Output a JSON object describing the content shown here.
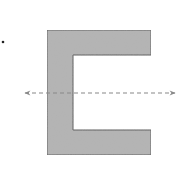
{
  "diagram": {
    "shape": {
      "type": "channel-section",
      "fill": "#b3b3b3",
      "stroke": "#555555",
      "outer_left": 47,
      "outer_top": 30,
      "outer_right": 151,
      "outer_bottom": 155,
      "flange_thickness": 25,
      "web_thickness": 26
    },
    "axis": {
      "type": "dashed-double-arrow",
      "y": 93,
      "x_start": 25,
      "x_end": 175,
      "color": "#888888"
    },
    "marker": {
      "type": "dot",
      "x": 3,
      "y": 42,
      "color": "#222222"
    }
  }
}
